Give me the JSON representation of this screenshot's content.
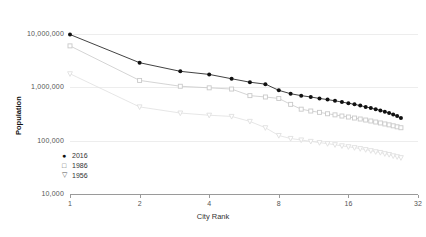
{
  "chart_data": {
    "type": "line",
    "title": "",
    "xlabel": "City Rank",
    "ylabel": "Population",
    "xscale": "log2",
    "yscale": "log10",
    "xlim": [
      1,
      32
    ],
    "ylim": [
      10000,
      20000000
    ],
    "xticks": [
      1,
      2,
      4,
      8,
      16,
      32
    ],
    "xtick_labels": [
      "1",
      "2",
      "4",
      "8",
      "16",
      "32"
    ],
    "yticks": [
      10000,
      100000,
      1000000,
      10000000
    ],
    "ytick_labels": [
      "10,000",
      "100,000",
      "1,000,000",
      "10,000,000"
    ],
    "grid": true,
    "legend_position": "lower-left",
    "series": [
      {
        "name": "2016",
        "marker": "filled-circle",
        "color": "#111111",
        "x": [
          1,
          2,
          3,
          4,
          5,
          6,
          7,
          8,
          9,
          10,
          11,
          12,
          13,
          14,
          15,
          16,
          17,
          18,
          19,
          20,
          21,
          22,
          23,
          24,
          25,
          26,
          27
        ],
        "values": [
          9800000,
          2900000,
          2000000,
          1750000,
          1450000,
          1250000,
          1150000,
          880000,
          760000,
          700000,
          660000,
          620000,
          590000,
          560000,
          530000,
          505000,
          480000,
          455000,
          430000,
          410000,
          390000,
          370000,
          350000,
          330000,
          310000,
          290000,
          265000
        ]
      },
      {
        "name": "1986",
        "marker": "open-square",
        "color": "#c9c9c9",
        "x": [
          1,
          2,
          3,
          4,
          5,
          6,
          7,
          8,
          9,
          10,
          11,
          12,
          13,
          14,
          15,
          16,
          17,
          18,
          19,
          20,
          21,
          22,
          23,
          24,
          25,
          26,
          27
        ],
        "values": [
          6000000,
          1350000,
          1050000,
          980000,
          930000,
          700000,
          660000,
          620000,
          480000,
          390000,
          360000,
          340000,
          320000,
          305000,
          290000,
          278000,
          266000,
          255000,
          244000,
          234000,
          224000,
          215000,
          206000,
          198000,
          190000,
          182000,
          175000
        ]
      },
      {
        "name": "1956",
        "marker": "open-triangle-down",
        "color": "#e0e0e0",
        "x": [
          1,
          2,
          3,
          4,
          5,
          6,
          7,
          8,
          9,
          10,
          11,
          12,
          13,
          14,
          15,
          16,
          17,
          18,
          19,
          20,
          21,
          22,
          23,
          24,
          25,
          26,
          27
        ],
        "values": [
          1800000,
          430000,
          330000,
          300000,
          285000,
          230000,
          175000,
          125000,
          110000,
          103000,
          97000,
          92000,
          88000,
          84000,
          80000,
          77000,
          74000,
          71000,
          68000,
          65000,
          62000,
          60000,
          57000,
          55000,
          52000,
          50000,
          48000
        ]
      }
    ]
  },
  "legend": {
    "items": [
      {
        "label": "2016",
        "symbol": "●"
      },
      {
        "label": "1986",
        "symbol": "□"
      },
      {
        "label": "1956",
        "symbol": "▽"
      }
    ]
  }
}
